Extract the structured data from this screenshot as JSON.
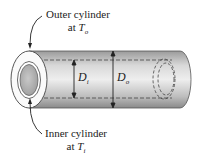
{
  "labels": {
    "outer": {
      "line1": "Outer cylinder",
      "line2_prefix": "at ",
      "var": "T",
      "sub": "o"
    },
    "inner": {
      "line1": "Inner cylinder",
      "line2_prefix": "at ",
      "var": "T",
      "sub": "i"
    },
    "di": {
      "var": "D",
      "sub": "i"
    },
    "do": {
      "var": "D",
      "sub": "o"
    }
  },
  "colors": {
    "tube_light": "#ececec",
    "tube_dark": "#8a8a8a",
    "stroke": "#333333",
    "core": "#b5b5b5"
  }
}
